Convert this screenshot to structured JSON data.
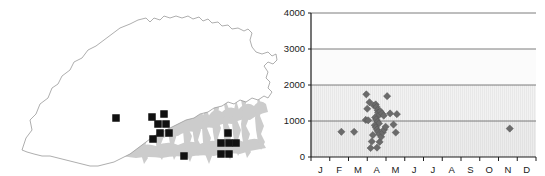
{
  "figure": {
    "panels": [
      "distribution-map",
      "elevation-by-month-scatter"
    ]
  },
  "map": {
    "name": "Bhutan distribution map",
    "country_outline_color": "#8c8c8c",
    "terrain_shading_color": "#c9c9c9",
    "record_marker_color": "#111111",
    "record_marker_shape": "square",
    "records": [
      {
        "x": 116,
        "y": 118
      },
      {
        "x": 152,
        "y": 117
      },
      {
        "x": 164,
        "y": 114
      },
      {
        "x": 158,
        "y": 124
      },
      {
        "x": 166,
        "y": 124
      },
      {
        "x": 169,
        "y": 133
      },
      {
        "x": 160,
        "y": 133
      },
      {
        "x": 153,
        "y": 139
      },
      {
        "x": 184,
        "y": 156
      },
      {
        "x": 228,
        "y": 133
      },
      {
        "x": 221,
        "y": 143
      },
      {
        "x": 229,
        "y": 143
      },
      {
        "x": 221,
        "y": 154
      },
      {
        "x": 229,
        "y": 154
      },
      {
        "x": 236,
        "y": 143
      }
    ]
  },
  "chart_data": {
    "type": "scatter",
    "title": "",
    "xlabel": "",
    "ylabel": "",
    "xlim": [
      0,
      12
    ],
    "ylim": [
      0,
      4000
    ],
    "grid": true,
    "gridlines_y": [
      1000,
      2000,
      3000,
      4000
    ],
    "legend": null,
    "x_tick_labels": [
      "J",
      "F",
      "M",
      "A",
      "M",
      "J",
      "J",
      "A",
      "S",
      "O",
      "N",
      "D"
    ],
    "y_tick_labels": [
      "0",
      "1000",
      "2000",
      "3000",
      "4000"
    ],
    "y_tick_values": [
      0,
      1000,
      2000,
      3000,
      4000
    ],
    "marker_shape": "diamond",
    "marker_color": "#6b6b6b",
    "marker_edge_color": "#555555",
    "points": [
      {
        "x": 1.62,
        "y": 700
      },
      {
        "x": 2.3,
        "y": 700
      },
      {
        "x": 2.92,
        "y": 1030
      },
      {
        "x": 2.95,
        "y": 1740
      },
      {
        "x": 3.12,
        "y": 1520
      },
      {
        "x": 3.0,
        "y": 1340
      },
      {
        "x": 3.35,
        "y": 1430
      },
      {
        "x": 3.45,
        "y": 1460
      },
      {
        "x": 3.5,
        "y": 1390
      },
      {
        "x": 3.55,
        "y": 1300
      },
      {
        "x": 3.58,
        "y": 1230
      },
      {
        "x": 3.62,
        "y": 1160
      },
      {
        "x": 3.42,
        "y": 1100
      },
      {
        "x": 3.48,
        "y": 1040
      },
      {
        "x": 3.55,
        "y": 980
      },
      {
        "x": 3.62,
        "y": 930
      },
      {
        "x": 3.7,
        "y": 1270
      },
      {
        "x": 3.78,
        "y": 1210
      },
      {
        "x": 3.88,
        "y": 1150
      },
      {
        "x": 3.4,
        "y": 880
      },
      {
        "x": 3.46,
        "y": 820
      },
      {
        "x": 3.52,
        "y": 760
      },
      {
        "x": 3.58,
        "y": 700
      },
      {
        "x": 3.64,
        "y": 640
      },
      {
        "x": 3.3,
        "y": 610
      },
      {
        "x": 3.24,
        "y": 430
      },
      {
        "x": 3.18,
        "y": 250
      },
      {
        "x": 3.52,
        "y": 260
      },
      {
        "x": 3.66,
        "y": 420
      },
      {
        "x": 3.74,
        "y": 560
      },
      {
        "x": 3.82,
        "y": 680
      },
      {
        "x": 3.9,
        "y": 760
      },
      {
        "x": 3.98,
        "y": 840
      },
      {
        "x": 4.22,
        "y": 1210
      },
      {
        "x": 4.06,
        "y": 1690
      },
      {
        "x": 4.4,
        "y": 900
      },
      {
        "x": 4.52,
        "y": 680
      },
      {
        "x": 4.58,
        "y": 1190
      },
      {
        "x": 3.05,
        "y": 1020
      },
      {
        "x": 10.6,
        "y": 790
      }
    ]
  }
}
